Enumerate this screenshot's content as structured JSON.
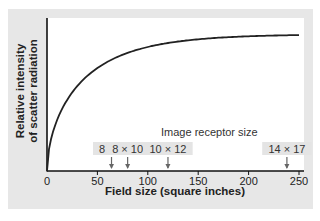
{
  "chart_data": {
    "type": "line",
    "title": "",
    "xlabel": "Field size (square inches)",
    "ylabel": "Relative intensity of scatter radiation",
    "ylabel_lines": [
      "Relative intensity",
      "of scatter radiation"
    ],
    "xlim": [
      0,
      255
    ],
    "x_ticks": [
      0,
      50,
      100,
      150,
      200,
      250
    ],
    "x_tick_labels": [
      "0",
      "50",
      "100",
      "150",
      "200",
      "250"
    ],
    "y_ticks": [],
    "grid": false,
    "series": [
      {
        "name": "Scatter radiation intensity",
        "x": [
          0,
          10,
          25,
          52,
          91,
          131,
          171,
          200,
          250
        ],
        "y": [
          0,
          0.4,
          0.49,
          0.62,
          0.74,
          0.83,
          0.9,
          0.94,
          0.95
        ]
      }
    ],
    "annotations": {
      "title": "Image receptor size",
      "markers": [
        {
          "label": "8 × 8",
          "x": 64
        },
        {
          "label": "8 × 10",
          "x": 80
        },
        {
          "label": "10 × 12",
          "x": 120
        },
        {
          "label": "14 × 17",
          "x": 238
        }
      ]
    },
    "colors": {
      "panel": "#e7e7e7",
      "plot": "#ffffff",
      "line": "#222222",
      "label_bg": "#e4e4e4",
      "arrow": "#666666"
    }
  }
}
